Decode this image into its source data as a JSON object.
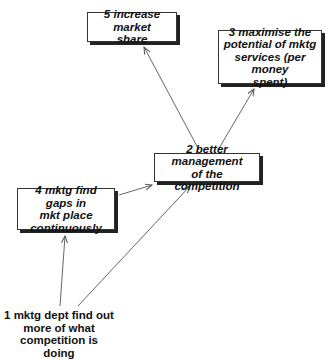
{
  "diagram": {
    "type": "cognitive-map",
    "colors": {
      "background": "#ffffff",
      "text": "#111111",
      "arrow": "#666666",
      "box_border": "#333333",
      "shadow": "#222222"
    },
    "nodes": [
      {
        "id": "5",
        "label": "5 increase market share",
        "lines": [
          "5 increase market",
          "share"
        ],
        "boxed": true
      },
      {
        "id": "3",
        "label": "3 maximise the potential of mktg services (per money spent)",
        "lines": [
          "3 maximise the",
          "potential of mktg",
          "services (per money",
          "spent)"
        ],
        "boxed": true
      },
      {
        "id": "2",
        "label": "2 better management of the competition",
        "lines": [
          "2 better management",
          "of the competition"
        ],
        "boxed": true
      },
      {
        "id": "4",
        "label": "4 mktg find gaps in mkt place continuously",
        "lines": [
          "4 mktg find gaps in",
          "mkt place",
          "continuously"
        ],
        "boxed": true
      },
      {
        "id": "1",
        "label": "1 mktg dept find out more of what competition is doing",
        "lines": [
          "1 mktg dept find out",
          "more of what",
          "competition is doing"
        ],
        "boxed": false
      }
    ],
    "edges": [
      {
        "from": "2",
        "to": "5"
      },
      {
        "from": "2",
        "to": "3"
      },
      {
        "from": "4",
        "to": "2"
      },
      {
        "from": "1",
        "to": "2"
      },
      {
        "from": "1",
        "to": "4"
      }
    ]
  }
}
